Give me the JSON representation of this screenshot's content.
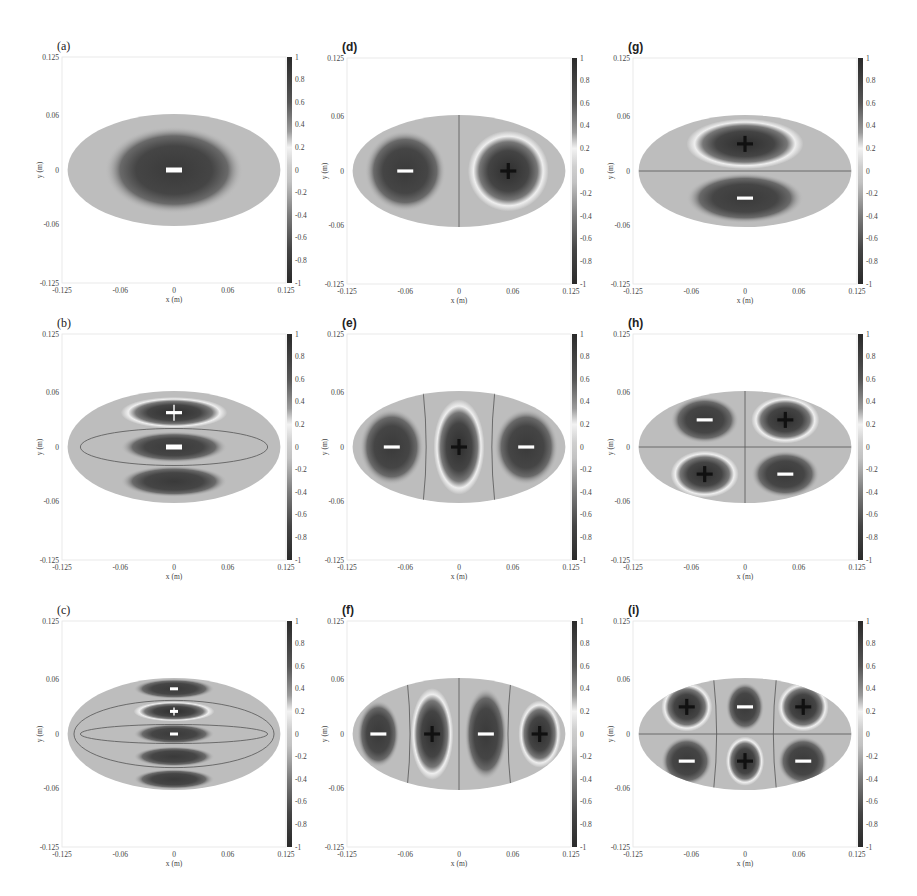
{
  "figure": {
    "colorbar_ticks": [
      "1",
      "0.8",
      "0.6",
      "0.4",
      "0.2",
      "0",
      "-0.2",
      "-0.4",
      "-0.6",
      "-0.8",
      "-1"
    ],
    "x_ticks": [
      "-0.125",
      "-0.06",
      "0",
      "0.06",
      "0.125"
    ],
    "y_ticks": [
      "0.125",
      "0.06",
      "0",
      "-0.06",
      "-0.125"
    ],
    "xlabel": "x (m)",
    "ylabel": "y (m)"
  },
  "panels": [
    {
      "id": "a",
      "label": "(a)",
      "bold": false
    },
    {
      "id": "b",
      "label": "(b)",
      "bold": false
    },
    {
      "id": "c",
      "label": "(c)",
      "bold": false
    },
    {
      "id": "d",
      "label": "(d)",
      "bold": true
    },
    {
      "id": "e",
      "label": "(e)",
      "bold": true
    },
    {
      "id": "f",
      "label": "(f)",
      "bold": true
    },
    {
      "id": "g",
      "label": "(g)",
      "bold": true
    },
    {
      "id": "h",
      "label": "(h)",
      "bold": true
    },
    {
      "id": "i",
      "label": "(i)",
      "bold": true
    }
  ],
  "chart_data": [
    {
      "panel": "a",
      "type": "heatmap",
      "title": "(a)",
      "xlabel": "x (m)",
      "ylabel": "y (m)",
      "xlim": [
        -0.125,
        0.125
      ],
      "ylim": [
        -0.125,
        0.125
      ],
      "clim": [
        -1,
        1
      ],
      "lobes": [
        {
          "x": 0,
          "y": 0,
          "sign": "-"
        }
      ],
      "nodal_lines": []
    },
    {
      "panel": "b",
      "type": "heatmap",
      "title": "(b)",
      "xlabel": "x (m)",
      "ylabel": "y (m)",
      "xlim": [
        -0.125,
        0.125
      ],
      "ylim": [
        -0.125,
        0.125
      ],
      "clim": [
        -1,
        1
      ],
      "lobes": [
        {
          "x": 0,
          "y": 0.038,
          "sign": "+"
        },
        {
          "x": 0,
          "y": 0,
          "sign": "-"
        },
        {
          "x": 0,
          "y": -0.038,
          "sign": ""
        }
      ],
      "nodal_lines": [
        "inner ellipse"
      ]
    },
    {
      "panel": "c",
      "type": "heatmap",
      "title": "(c)",
      "xlabel": "x (m)",
      "ylabel": "y (m)",
      "xlim": [
        -0.125,
        0.125
      ],
      "ylim": [
        -0.125,
        0.125
      ],
      "clim": [
        -1,
        1
      ],
      "lobes": [
        {
          "x": 0,
          "y": 0.05,
          "sign": "-"
        },
        {
          "x": 0,
          "y": 0.025,
          "sign": "+"
        },
        {
          "x": 0,
          "y": 0,
          "sign": "-"
        },
        {
          "x": 0,
          "y": -0.025,
          "sign": ""
        },
        {
          "x": 0,
          "y": -0.05,
          "sign": ""
        }
      ],
      "nodal_lines": [
        "outer ellipse",
        "inner ellipse"
      ]
    },
    {
      "panel": "d",
      "type": "heatmap",
      "title": "(d)",
      "xlabel": "x (m)",
      "ylabel": "y (m)",
      "xlim": [
        -0.125,
        0.125
      ],
      "ylim": [
        -0.125,
        0.125
      ],
      "clim": [
        -1,
        1
      ],
      "lobes": [
        {
          "x": -0.06,
          "y": 0,
          "sign": "-"
        },
        {
          "x": 0.055,
          "y": 0,
          "sign": "+"
        }
      ],
      "nodal_lines": [
        "x=0"
      ]
    },
    {
      "panel": "e",
      "type": "heatmap",
      "title": "(e)",
      "xlabel": "x (m)",
      "ylabel": "y (m)",
      "xlim": [
        -0.125,
        0.125
      ],
      "ylim": [
        -0.125,
        0.125
      ],
      "clim": [
        -1,
        1
      ],
      "lobes": [
        {
          "x": -0.075,
          "y": 0,
          "sign": "-"
        },
        {
          "x": 0,
          "y": 0,
          "sign": "+"
        },
        {
          "x": 0.075,
          "y": 0,
          "sign": "-"
        }
      ],
      "nodal_lines": [
        "x≈-0.04 (curved)",
        "x≈0.04 (curved)"
      ]
    },
    {
      "panel": "f",
      "type": "heatmap",
      "title": "(f)",
      "xlabel": "x (m)",
      "ylabel": "y (m)",
      "xlim": [
        -0.125,
        0.125
      ],
      "ylim": [
        -0.125,
        0.125
      ],
      "clim": [
        -1,
        1
      ],
      "lobes": [
        {
          "x": -0.09,
          "y": 0,
          "sign": "-"
        },
        {
          "x": -0.03,
          "y": 0,
          "sign": "+"
        },
        {
          "x": 0.03,
          "y": 0,
          "sign": "-"
        },
        {
          "x": 0.09,
          "y": 0,
          "sign": "+"
        }
      ],
      "nodal_lines": [
        "x≈-0.06 (curved)",
        "x=0",
        "x≈0.06 (curved)"
      ]
    },
    {
      "panel": "g",
      "type": "heatmap",
      "title": "(g)",
      "xlabel": "x (m)",
      "ylabel": "y (m)",
      "xlim": [
        -0.125,
        0.125
      ],
      "ylim": [
        -0.125,
        0.125
      ],
      "clim": [
        -1,
        1
      ],
      "lobes": [
        {
          "x": 0,
          "y": 0.03,
          "sign": "+"
        },
        {
          "x": 0,
          "y": -0.03,
          "sign": "-"
        }
      ],
      "nodal_lines": [
        "y=0"
      ]
    },
    {
      "panel": "h",
      "type": "heatmap",
      "title": "(h)",
      "xlabel": "x (m)",
      "ylabel": "y (m)",
      "xlim": [
        -0.125,
        0.125
      ],
      "ylim": [
        -0.125,
        0.125
      ],
      "clim": [
        -1,
        1
      ],
      "lobes": [
        {
          "x": -0.045,
          "y": 0.03,
          "sign": "-"
        },
        {
          "x": 0.045,
          "y": 0.03,
          "sign": "+"
        },
        {
          "x": -0.045,
          "y": -0.03,
          "sign": "+"
        },
        {
          "x": 0.045,
          "y": -0.03,
          "sign": "-"
        }
      ],
      "nodal_lines": [
        "x=0",
        "y=0"
      ]
    },
    {
      "panel": "i",
      "type": "heatmap",
      "title": "(i)",
      "xlabel": "x (m)",
      "ylabel": "y (m)",
      "xlim": [
        -0.125,
        0.125
      ],
      "ylim": [
        -0.125,
        0.125
      ],
      "clim": [
        -1,
        1
      ],
      "lobes": [
        {
          "x": -0.065,
          "y": 0.03,
          "sign": "+"
        },
        {
          "x": 0,
          "y": 0.03,
          "sign": "-"
        },
        {
          "x": 0.065,
          "y": 0.03,
          "sign": "+"
        },
        {
          "x": -0.065,
          "y": -0.03,
          "sign": "-"
        },
        {
          "x": 0,
          "y": -0.03,
          "sign": "+"
        },
        {
          "x": 0.065,
          "y": -0.03,
          "sign": "-"
        }
      ],
      "nodal_lines": [
        "x≈-0.04 (curved)",
        "x≈0.04 (curved)",
        "y=0"
      ]
    }
  ]
}
